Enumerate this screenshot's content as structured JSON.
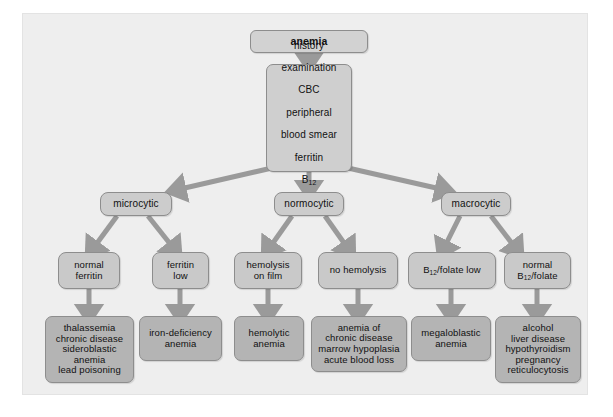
{
  "diagram": {
    "colors": {
      "page_background": "#ffffff",
      "panel_background": "#eeeeee",
      "node_fill_light": "#cfcfcf",
      "node_fill_result": "#b4b4b4",
      "node_border": "#8d8d8d",
      "arrow": "#9a9a9a",
      "text": "#111111"
    },
    "nodes": {
      "root": "anemia",
      "workup": "history\nexamination\nCBC\nperipheral\nblood smear\nferritin\nB12\nfolate",
      "workup_lines": [
        "history",
        "examination",
        "CBC",
        "peripheral",
        "blood smear",
        "ferritin",
        "B12",
        "folate"
      ],
      "microcytic": "microcytic",
      "normocytic": "normocytic",
      "macrocytic": "macrocytic",
      "normal_ferritin": "normal\nferritin",
      "ferritin_low": "ferritin\nlow",
      "hemolysis_on_film": "hemolysis\non film",
      "no_hemolysis": "no hemolysis",
      "b12_folate_low": "B12/folate low",
      "normal_b12_folate": "normal\nB12/folate",
      "result_microcytic_normal_ferritin": "thalassemia\nchronic disease\nsideroblastic\nanemia\nlead poisoning",
      "result_ferritin_low": "iron-deficiency\nanemia",
      "result_hemolysis": "hemolytic\nanemia",
      "result_no_hemolysis": "anemia of\nchronic disease\nmarrow hypoplasia\nacute blood loss",
      "result_b12_folate_low": "megaloblastic\nanemia",
      "result_normal_b12_folate": "alcohol\nliver disease\nhypothyroidism\npregnancy\nreticulocytosis"
    }
  }
}
